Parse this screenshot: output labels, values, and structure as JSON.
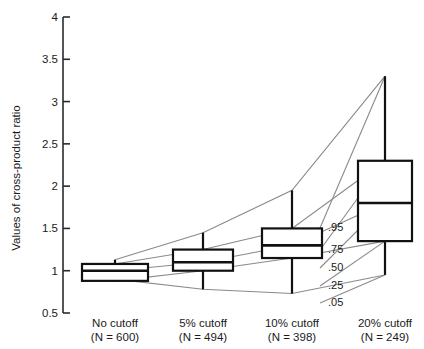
{
  "chart_data": {
    "type": "box",
    "title": "",
    "xlabel": "",
    "ylabel": "Values of cross-product ratio",
    "ylim": [
      0.5,
      4
    ],
    "yticks": [
      "0.5",
      "1",
      "1.5",
      "2",
      "2.5",
      "3",
      "3.5",
      "4"
    ],
    "ytick_values": [
      0.5,
      1,
      1.5,
      2,
      2.5,
      3,
      3.5,
      4
    ],
    "grid": false,
    "legend": "none",
    "categories": [
      "No cutoff",
      "5% cutoff",
      "10% cutoff",
      "20% cutoff"
    ],
    "category_sublabels": [
      "(N = 600)",
      "(N = 494)",
      "(N = 398)",
      "(N = 249)"
    ],
    "percentile_labels": [
      ".95",
      ".75",
      ".50",
      ".25",
      ".05"
    ],
    "percentile_values": [
      0.95,
      0.75,
      0.5,
      0.25,
      0.05
    ],
    "boxes": [
      {
        "category": "No cutoff",
        "n": 600,
        "p05": 0.9,
        "p25": 0.88,
        "p50": 1.0,
        "p75": 1.08,
        "p95": 1.13
      },
      {
        "category": "5% cutoff",
        "n": 494,
        "p05": 0.78,
        "p25": 1.0,
        "p50": 1.1,
        "p75": 1.25,
        "p95": 1.45
      },
      {
        "category": "10% cutoff",
        "n": 398,
        "p05": 0.73,
        "p25": 1.15,
        "p50": 1.3,
        "p75": 1.5,
        "p95": 1.95
      },
      {
        "category": "20% cutoff",
        "n": 249,
        "p05": 0.95,
        "p25": 1.35,
        "p50": 1.8,
        "p75": 2.3,
        "p95": 3.3
      }
    ],
    "colors": {
      "box_stroke": "#111111",
      "connector": "#8a8a8a",
      "axis": "#2b2b2b",
      "background": "#ffffff"
    }
  },
  "axis": {
    "y_title": "Values of cross-product ratio"
  }
}
